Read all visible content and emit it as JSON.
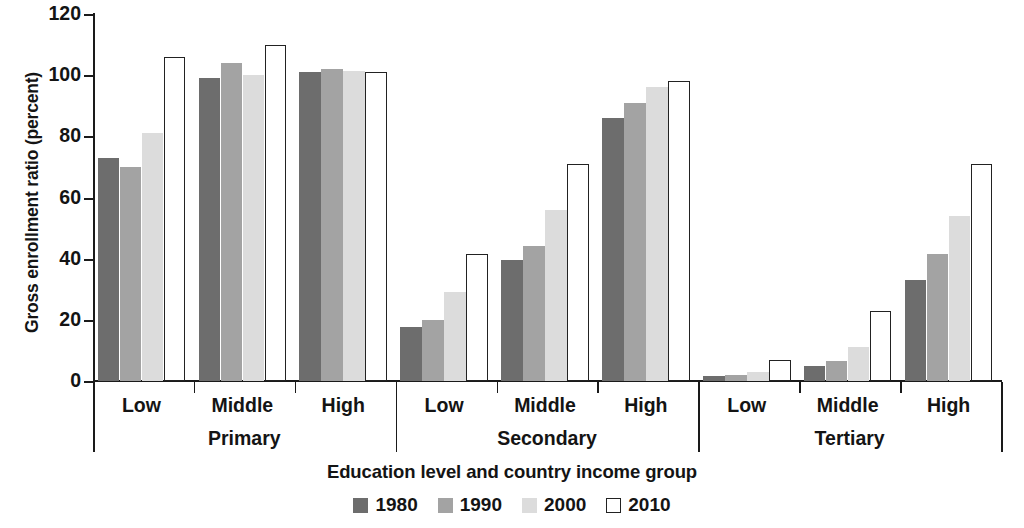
{
  "chart_data": {
    "type": "bar",
    "title": "",
    "xlabel": "Education level and country income group",
    "ylabel": "Gross enrollment ratio (percent)",
    "ylim": [
      0,
      120
    ],
    "yticks": [
      0,
      20,
      40,
      60,
      80,
      100,
      120
    ],
    "grid": false,
    "legend_position": "bottom",
    "group_labels": [
      "Primary",
      "Secondary",
      "Tertiary"
    ],
    "categories": [
      "Primary / Low",
      "Primary / Middle",
      "Primary / High",
      "Secondary / Low",
      "Secondary / Middle",
      "Secondary / High",
      "Tertiary / Low",
      "Tertiary / Middle",
      "Tertiary / High"
    ],
    "subcategories": [
      "Low",
      "Middle",
      "High"
    ],
    "series": [
      {
        "name": "1980",
        "color": "#6d6d6d",
        "values": [
          73,
          99,
          101,
          17.5,
          39.5,
          86,
          1.5,
          5,
          33
        ]
      },
      {
        "name": "1990",
        "color": "#a3a3a3",
        "values": [
          70,
          104,
          102,
          20,
          44,
          91,
          2,
          6.5,
          41.5
        ]
      },
      {
        "name": "2000",
        "color": "#dcdcdc",
        "values": [
          81,
          100,
          101.5,
          29,
          56,
          96,
          3,
          11,
          54
        ]
      },
      {
        "name": "2010",
        "color": "#ffffff",
        "values": [
          106,
          110,
          101,
          41.5,
          71,
          98,
          7,
          23,
          71
        ]
      }
    ]
  },
  "axis": {
    "y_title": "Gross enrollment ratio (percent)",
    "y_ticks": [
      "0",
      "20",
      "40",
      "60",
      "80",
      "100",
      "120"
    ],
    "x_title": "Education level and country income group",
    "income_labels": [
      "Low",
      "Middle",
      "High",
      "Low",
      "Middle",
      "High",
      "Low",
      "Middle",
      "High"
    ],
    "education_labels": [
      "Primary",
      "Secondary",
      "Tertiary"
    ]
  },
  "legend": {
    "items": [
      {
        "label": "1980",
        "swatch": "dark-gray-swatch"
      },
      {
        "label": "1990",
        "swatch": "medium-gray-swatch"
      },
      {
        "label": "2000",
        "swatch": "light-gray-swatch"
      },
      {
        "label": "2010",
        "swatch": "white-outline-swatch"
      }
    ]
  }
}
